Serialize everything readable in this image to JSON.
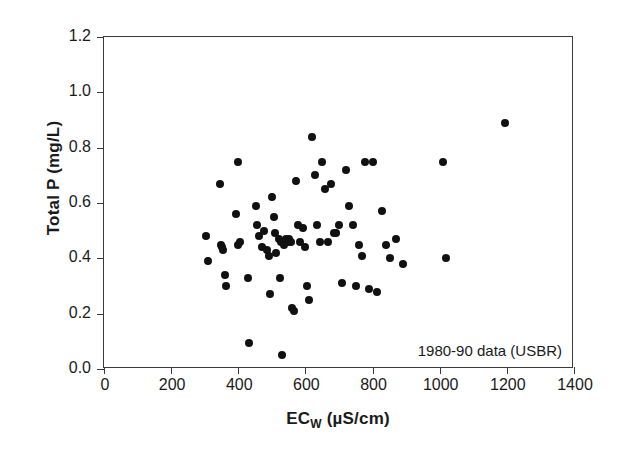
{
  "chart_data": {
    "type": "scatter",
    "title": "",
    "xlabel": "EC_W (µS/cm)",
    "xlabel_main": "EC",
    "xlabel_sub": "W",
    "xlabel_units": " (µS/cm)",
    "ylabel": "Total P (mg/L)",
    "xlim": [
      0,
      1400
    ],
    "ylim": [
      0.0,
      1.2
    ],
    "xticks": [
      0,
      200,
      400,
      600,
      800,
      1000,
      1200,
      1400
    ],
    "xtick_labels": [
      "0",
      "200",
      "400",
      "600",
      "800",
      "1000",
      "1200",
      "1400"
    ],
    "yticks": [
      0.0,
      0.2,
      0.4,
      0.6,
      0.8,
      1.0,
      1.2
    ],
    "ytick_labels": [
      "0.0",
      "0.2",
      "0.4",
      "0.6",
      "0.8",
      "1.0",
      "1.2"
    ],
    "grid": false,
    "legend": null,
    "marker": "filled-circle",
    "marker_color": "#111111",
    "annotations": [
      {
        "text": "1980-90 data (USBR)",
        "x": 1000,
        "y": 0.1
      }
    ],
    "x": [
      303,
      310,
      345,
      348,
      352,
      355,
      360,
      362,
      393,
      398,
      400,
      405,
      430,
      432,
      452,
      456,
      462,
      470,
      478,
      485,
      490,
      495,
      500,
      505,
      508,
      512,
      520,
      525,
      528,
      530,
      536,
      542,
      548,
      552,
      556,
      560,
      566,
      572,
      578,
      585,
      592,
      600,
      605,
      612,
      620,
      628,
      635,
      643,
      650,
      658,
      668,
      676,
      684,
      692,
      700,
      710,
      722,
      730,
      742,
      752,
      760,
      768,
      778,
      790,
      800,
      812,
      828,
      840,
      852,
      870,
      890,
      1010,
      1020,
      1195
    ],
    "y": [
      0.48,
      0.39,
      0.67,
      0.45,
      0.44,
      0.43,
      0.34,
      0.3,
      0.56,
      0.75,
      0.45,
      0.46,
      0.33,
      0.095,
      0.59,
      0.52,
      0.48,
      0.44,
      0.5,
      0.43,
      0.41,
      0.27,
      0.62,
      0.55,
      0.49,
      0.42,
      0.47,
      0.33,
      0.46,
      0.05,
      0.45,
      0.47,
      0.46,
      0.47,
      0.46,
      0.22,
      0.21,
      0.68,
      0.52,
      0.46,
      0.51,
      0.44,
      0.3,
      0.25,
      0.84,
      0.7,
      0.52,
      0.46,
      0.75,
      0.65,
      0.46,
      0.67,
      0.49,
      0.49,
      0.52,
      0.31,
      0.72,
      0.59,
      0.52,
      0.3,
      0.45,
      0.41,
      0.75,
      0.29,
      0.75,
      0.28,
      0.57,
      0.45,
      0.4,
      0.47,
      0.38,
      0.75,
      0.4,
      0.89
    ]
  },
  "annotation": {
    "text": "1980-90 data (USBR)"
  },
  "axes": {
    "x_title_main": "EC",
    "x_title_sub": "W",
    "x_title_units": " (µS/cm)",
    "y_title": "Total P (mg/L)"
  }
}
